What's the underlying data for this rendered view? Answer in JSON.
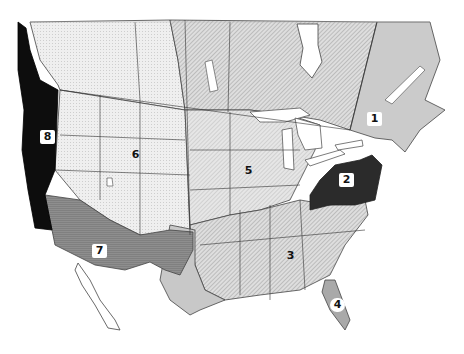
{
  "map": {
    "colors": {
      "background": "#ffffff",
      "canada_west": "#e9e9e9",
      "canada_central_hatched": "#cfcfcf",
      "region_1": "#c8c8c8",
      "region_2": "#2b2b2b",
      "region_3": "#c9c9c9",
      "region_4": "#a9a9a9",
      "region_5": "#d2d2d2",
      "region_6": "#ececec",
      "region_7": "#8a8a8a",
      "region_8": "#0d0d0d",
      "borders": "#333333",
      "water": "#ffffff"
    },
    "regions": [
      {
        "id": "1",
        "label": "1"
      },
      {
        "id": "2",
        "label": "2"
      },
      {
        "id": "3",
        "label": "3"
      },
      {
        "id": "4",
        "label": "4"
      },
      {
        "id": "5",
        "label": "5"
      },
      {
        "id": "6",
        "label": "6"
      },
      {
        "id": "7",
        "label": "7"
      },
      {
        "id": "8",
        "label": "8"
      }
    ]
  }
}
